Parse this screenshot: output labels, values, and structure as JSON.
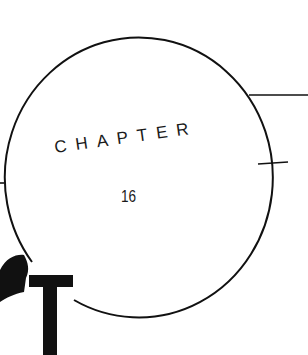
{
  "chapter": {
    "label": "CHAPTER",
    "number": "16",
    "drop_cap": "T"
  },
  "colors": {
    "ink": "#111111",
    "paper": "#ffffff"
  }
}
